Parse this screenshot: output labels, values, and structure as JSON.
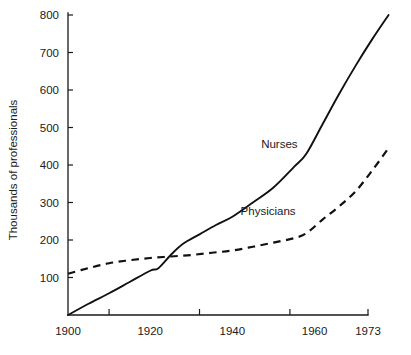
{
  "chart_data": {
    "type": "line",
    "title": "",
    "subtitle": "",
    "xlabel": "",
    "ylabel": "Thousands of professionals",
    "xlim": [
      1900,
      1978
    ],
    "ylim": [
      0,
      800
    ],
    "grid": false,
    "legend_position": "inline-annotation",
    "y_ticks": [
      100,
      200,
      300,
      400,
      500,
      600,
      700,
      800
    ],
    "y_tick_labels": [
      "100",
      "200",
      "300",
      "400",
      "500",
      "600",
      "700",
      "800"
    ],
    "x_tick_labels": [
      "1900",
      "1920",
      "1940",
      "1960",
      "1973"
    ],
    "x_tick_label_values": [
      1900,
      1920,
      1940,
      1960,
      1973
    ],
    "x_tick_mark_values": [
      1910,
      1932,
      1954,
      1973
    ],
    "annotations": [
      {
        "text": "Nurses",
        "x": 1947,
        "y": 445,
        "series": "Nurses"
      },
      {
        "text": "Physicians",
        "x": 1942,
        "y": 268,
        "series": "Physicians"
      }
    ],
    "series": [
      {
        "name": "Nurses",
        "style": "solid",
        "color": "#111111",
        "x": [
          1900,
          1905,
          1910,
          1915,
          1920,
          1922,
          1925,
          1928,
          1932,
          1936,
          1940,
          1945,
          1950,
          1955,
          1958,
          1962,
          1966,
          1970,
          1974,
          1978
        ],
        "values": [
          0,
          30,
          58,
          88,
          118,
          125,
          160,
          190,
          215,
          240,
          262,
          300,
          340,
          395,
          430,
          510,
          590,
          665,
          735,
          800
        ]
      },
      {
        "name": "Physicians",
        "style": "dashed",
        "color": "#111111",
        "x": [
          1900,
          1905,
          1910,
          1915,
          1920,
          1925,
          1930,
          1935,
          1940,
          1945,
          1950,
          1955,
          1958,
          1962,
          1966,
          1970,
          1974,
          1978
        ],
        "values": [
          110,
          125,
          138,
          146,
          152,
          156,
          160,
          166,
          172,
          182,
          193,
          205,
          218,
          255,
          290,
          330,
          385,
          445
        ]
      }
    ]
  },
  "axis_titles": {
    "y": "Thousands of professionals"
  },
  "series_labels": {
    "nurses": "Nurses",
    "physicians": "Physicians"
  }
}
